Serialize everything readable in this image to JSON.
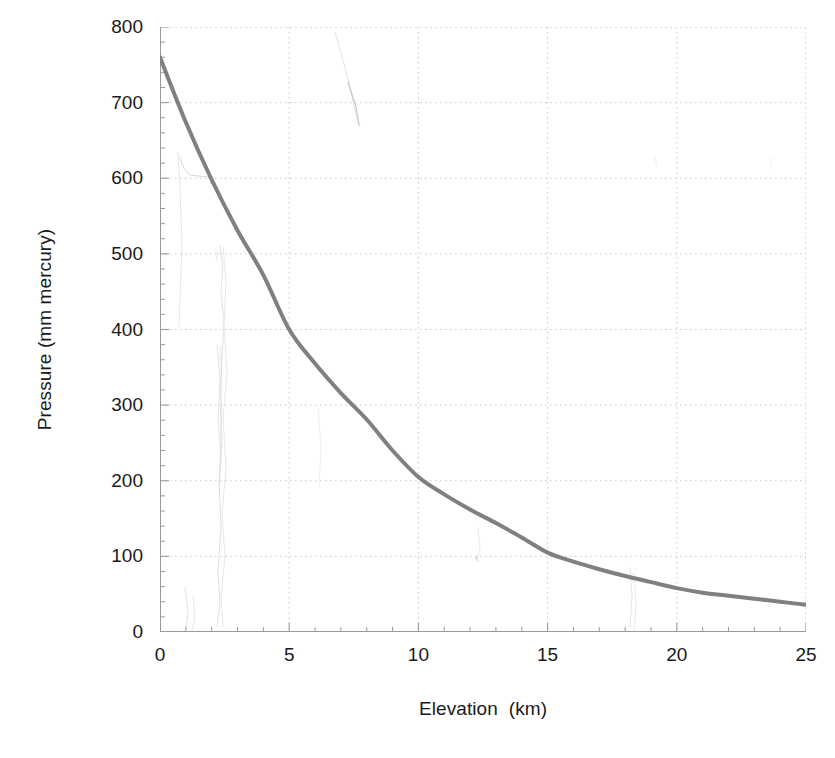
{
  "chart_data": {
    "type": "line",
    "title": "",
    "xlabel": "Elevation  (km)",
    "ylabel": "Pressure (mm mercury)",
    "xlim": [
      0,
      25
    ],
    "ylim": [
      0,
      800
    ],
    "xticks": [
      0,
      5,
      10,
      15,
      20,
      25
    ],
    "yticks": [
      0,
      100,
      200,
      300,
      400,
      500,
      600,
      700,
      800
    ],
    "xtick_labels": [
      "0",
      "5",
      "10",
      "15",
      "20",
      "25"
    ],
    "ytick_labels": [
      "0",
      "100",
      "200",
      "300",
      "400",
      "500",
      "600",
      "700",
      "800"
    ],
    "x_minor_step": 1,
    "y_minor_step": 20,
    "grid": true,
    "grid_style": "dotted",
    "legend": null,
    "series": [
      {
        "name": "Atmospheric pressure",
        "color": "#808080",
        "line_width": 4,
        "x": [
          0,
          1,
          2,
          3,
          4,
          5,
          6,
          7,
          8,
          9,
          10,
          11,
          12,
          13,
          14,
          15,
          16,
          17,
          18,
          19,
          20,
          21,
          22,
          23,
          24,
          25
        ],
        "y": [
          760,
          674,
          598,
          531,
          472,
          400,
          355,
          316,
          281,
          240,
          205,
          182,
          162,
          144,
          125,
          105,
          93,
          83,
          74,
          66,
          58,
          52,
          48,
          44,
          40,
          36
        ]
      }
    ]
  },
  "figure": {
    "background_color": "#ffffff",
    "axis_color": "#9a9a9a",
    "grid_color": "#c9c9c9",
    "text_color": "#1a1a1a",
    "curve_color": "#808080"
  },
  "artifacts": {
    "description": "faint scanned pencil/streak marks in background",
    "color": "#d9d9d9"
  }
}
